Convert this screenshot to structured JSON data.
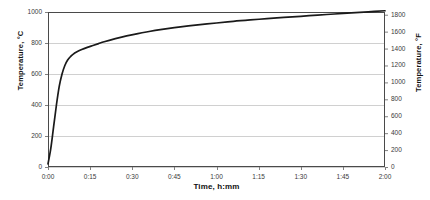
{
  "chart_data": {
    "type": "line",
    "title": "",
    "xlabel": "Time, h:mm",
    "ylabel": "Temperature, °C",
    "y2label": "Temperature, °F",
    "grid": true,
    "legend": "none",
    "xlim": [
      0,
      120
    ],
    "ylim": [
      0,
      1000
    ],
    "y2lim": [
      0,
      1832
    ],
    "x_tick_labels": [
      "0:00",
      "0:15",
      "0:30",
      "0:45",
      "1:00",
      "1:15",
      "1:30",
      "1:45",
      "2:00"
    ],
    "x_tick_values": [
      0,
      15,
      30,
      45,
      60,
      75,
      90,
      105,
      120
    ],
    "y_tick_labels": [
      "0",
      "200",
      "400",
      "600",
      "800",
      "1000"
    ],
    "y_tick_values": [
      0,
      200,
      400,
      600,
      800,
      1000
    ],
    "y2_tick_labels": [
      "0",
      "200",
      "400",
      "600",
      "800",
      "1000",
      "1200",
      "1400",
      "1600",
      "1800"
    ],
    "y2_tick_values": [
      0,
      200,
      400,
      600,
      800,
      1000,
      1200,
      1400,
      1600,
      1800
    ],
    "series": [
      {
        "name": "Temperature",
        "color": "#1a1a1a",
        "x": [
          0,
          1,
          2,
          3,
          4,
          5,
          6,
          7,
          8,
          9,
          10,
          12,
          14,
          16,
          18,
          20,
          24,
          28,
          32,
          36,
          40,
          45,
          50,
          55,
          60,
          66,
          72,
          78,
          84,
          90,
          96,
          102,
          108,
          114,
          120
        ],
        "values": [
          20,
          120,
          260,
          400,
          520,
          600,
          655,
          690,
          712,
          728,
          740,
          758,
          772,
          784,
          796,
          808,
          828,
          846,
          861,
          874,
          886,
          899,
          910,
          920,
          929,
          940,
          949,
          957,
          965,
          972,
          980,
          987,
          994,
          1001,
          1008
        ]
      }
    ],
    "colors": {
      "curve": "#1a1a1a",
      "frame": "#4a4a4a",
      "gridline": "#d0d0d0",
      "tick": "#808080",
      "background": "#ffffff",
      "text": "#111111"
    }
  },
  "geometry": {
    "plot_left": 48,
    "plot_right": 385,
    "plot_top": 12,
    "plot_bottom": 167
  }
}
